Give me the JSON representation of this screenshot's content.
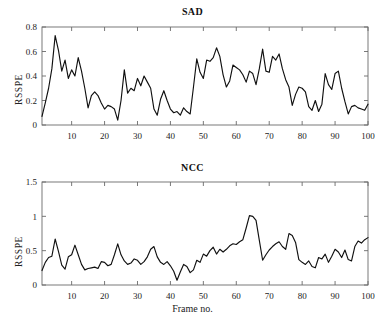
{
  "figure": {
    "background": "#ffffff",
    "line_color": "#101010",
    "axis_color": "#6a6a6a"
  },
  "panels": {
    "sad": {
      "title": "SAD",
      "ylabel": "RSSPE",
      "xlabel": "",
      "ytick_labels": [
        "0",
        "0.2",
        "0.4",
        "0.6",
        "0.8"
      ],
      "xtick_labels": [
        "10",
        "20",
        "30",
        "40",
        "50",
        "60",
        "70",
        "80",
        "90",
        "100"
      ]
    },
    "ncc": {
      "title": "NCC",
      "ylabel": "RSSPE",
      "xlabel": "Frame no.",
      "ytick_labels": [
        "0",
        "0.5",
        "1",
        "1.5"
      ],
      "xtick_labels": [
        "10",
        "20",
        "30",
        "40",
        "50",
        "60",
        "70",
        "80",
        "90",
        "100"
      ]
    }
  },
  "chart_data": [
    {
      "type": "line",
      "title": "SAD",
      "xlabel": "",
      "ylabel": "RSSPE",
      "xlim": [
        1,
        100
      ],
      "ylim": [
        0,
        0.8
      ],
      "xticks": [
        10,
        20,
        30,
        40,
        50,
        60,
        70,
        80,
        90,
        100
      ],
      "yticks": [
        0,
        0.2,
        0.4,
        0.6,
        0.8
      ],
      "grid": false,
      "legend": null,
      "x": [
        1,
        2,
        3,
        4,
        5,
        6,
        7,
        8,
        9,
        10,
        11,
        12,
        13,
        14,
        15,
        16,
        17,
        18,
        19,
        20,
        21,
        22,
        23,
        24,
        25,
        26,
        27,
        28,
        29,
        30,
        31,
        32,
        33,
        34,
        35,
        36,
        37,
        38,
        39,
        40,
        41,
        42,
        43,
        44,
        45,
        46,
        47,
        48,
        49,
        50,
        51,
        52,
        53,
        54,
        55,
        56,
        57,
        58,
        59,
        60,
        61,
        62,
        63,
        64,
        65,
        66,
        67,
        68,
        69,
        70,
        71,
        72,
        73,
        74,
        75,
        76,
        77,
        78,
        79,
        80,
        81,
        82,
        83,
        84,
        85,
        86,
        87,
        88,
        89,
        90,
        91,
        92,
        93,
        94,
        95,
        96,
        97,
        98,
        99,
        100
      ],
      "values": [
        0.07,
        0.18,
        0.3,
        0.46,
        0.73,
        0.61,
        0.44,
        0.53,
        0.38,
        0.45,
        0.4,
        0.55,
        0.44,
        0.3,
        0.14,
        0.24,
        0.27,
        0.24,
        0.18,
        0.13,
        0.16,
        0.15,
        0.13,
        0.04,
        0.2,
        0.45,
        0.26,
        0.3,
        0.28,
        0.38,
        0.32,
        0.4,
        0.35,
        0.3,
        0.13,
        0.08,
        0.21,
        0.28,
        0.2,
        0.13,
        0.1,
        0.11,
        0.08,
        0.14,
        0.11,
        0.09,
        0.31,
        0.54,
        0.43,
        0.38,
        0.53,
        0.52,
        0.55,
        0.63,
        0.56,
        0.41,
        0.31,
        0.36,
        0.49,
        0.47,
        0.45,
        0.41,
        0.35,
        0.44,
        0.42,
        0.33,
        0.46,
        0.62,
        0.44,
        0.43,
        0.56,
        0.53,
        0.58,
        0.46,
        0.37,
        0.31,
        0.16,
        0.25,
        0.31,
        0.3,
        0.27,
        0.15,
        0.12,
        0.2,
        0.11,
        0.17,
        0.42,
        0.33,
        0.29,
        0.42,
        0.44,
        0.3,
        0.19,
        0.09,
        0.15,
        0.16,
        0.14,
        0.13,
        0.12,
        0.17,
        0.14,
        0.1,
        0.05,
        0.2
      ],
      "series_note": "RSSPE per frame for SAD matching"
    },
    {
      "type": "line",
      "title": "NCC",
      "xlabel": "Frame no.",
      "ylabel": "RSSPE",
      "xlim": [
        1,
        100
      ],
      "ylim": [
        0,
        1.5
      ],
      "xticks": [
        10,
        20,
        30,
        40,
        50,
        60,
        70,
        80,
        90,
        100
      ],
      "yticks": [
        0,
        0.5,
        1,
        1.5
      ],
      "grid": false,
      "legend": null,
      "x": [
        1,
        2,
        3,
        4,
        5,
        6,
        7,
        8,
        9,
        10,
        11,
        12,
        13,
        14,
        15,
        16,
        17,
        18,
        19,
        20,
        21,
        22,
        23,
        24,
        25,
        26,
        27,
        28,
        29,
        30,
        31,
        32,
        33,
        34,
        35,
        36,
        37,
        38,
        39,
        40,
        41,
        42,
        43,
        44,
        45,
        46,
        47,
        48,
        49,
        50,
        51,
        52,
        53,
        54,
        55,
        56,
        57,
        58,
        59,
        60,
        61,
        62,
        63,
        64,
        65,
        66,
        67,
        68,
        69,
        70,
        71,
        72,
        73,
        74,
        75,
        76,
        77,
        78,
        79,
        80,
        81,
        82,
        83,
        84,
        85,
        86,
        87,
        88,
        89,
        90,
        91,
        92,
        93,
        94,
        95,
        96,
        97,
        98,
        99,
        100
      ],
      "values": [
        0.21,
        0.33,
        0.4,
        0.42,
        0.67,
        0.49,
        0.29,
        0.23,
        0.41,
        0.44,
        0.58,
        0.44,
        0.3,
        0.22,
        0.24,
        0.25,
        0.26,
        0.24,
        0.34,
        0.33,
        0.28,
        0.3,
        0.44,
        0.6,
        0.44,
        0.35,
        0.3,
        0.32,
        0.38,
        0.36,
        0.3,
        0.34,
        0.41,
        0.52,
        0.56,
        0.41,
        0.33,
        0.3,
        0.34,
        0.28,
        0.2,
        0.07,
        0.19,
        0.3,
        0.27,
        0.18,
        0.22,
        0.36,
        0.33,
        0.45,
        0.42,
        0.5,
        0.55,
        0.45,
        0.52,
        0.48,
        0.52,
        0.57,
        0.6,
        0.59,
        0.63,
        0.66,
        0.83,
        1.01,
        1.0,
        0.94,
        0.65,
        0.36,
        0.44,
        0.51,
        0.56,
        0.6,
        0.63,
        0.56,
        0.52,
        0.75,
        0.72,
        0.62,
        0.37,
        0.33,
        0.3,
        0.35,
        0.27,
        0.25,
        0.4,
        0.38,
        0.45,
        0.33,
        0.42,
        0.52,
        0.48,
        0.4,
        0.51,
        0.37,
        0.35,
        0.56,
        0.64,
        0.61,
        0.66,
        0.69
      ],
      "series_note": "RSSPE per frame for NCC matching"
    }
  ]
}
